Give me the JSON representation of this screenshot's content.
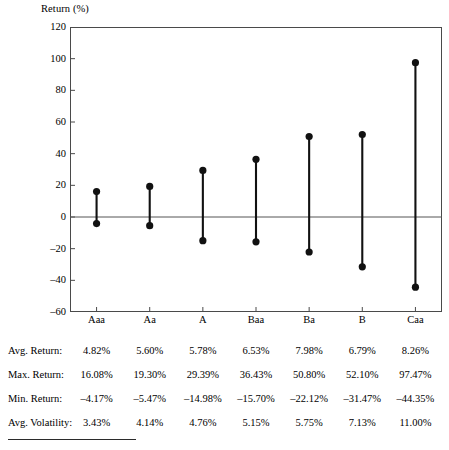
{
  "chart_data": {
    "type": "scatter",
    "title": "",
    "subtitle": "",
    "ylabel": "Return (%)",
    "xlabel": "",
    "ylim": [
      -60,
      120
    ],
    "yticks": [
      120,
      100,
      80,
      60,
      40,
      20,
      0,
      -20,
      -40,
      -60
    ],
    "ytick_labels": [
      "120",
      "100",
      "80",
      "60",
      "40",
      "20",
      "0",
      "–20",
      "–40",
      "–60"
    ],
    "grid": false,
    "legend": "none",
    "zero_line": 0,
    "categories": [
      "Aaa",
      "Aa",
      "A",
      "Baa",
      "Ba",
      "B",
      "Caa"
    ],
    "series": [
      {
        "name": "Max. Return",
        "values": [
          16.08,
          19.3,
          29.39,
          36.43,
          50.8,
          52.1,
          97.47
        ]
      },
      {
        "name": "Min. Return",
        "values": [
          -4.17,
          -5.47,
          -14.98,
          -15.7,
          -22.12,
          -31.47,
          -44.35
        ]
      }
    ],
    "marker": "filled-circle",
    "marker_color": "#111111",
    "stem_color": "#111111",
    "frame_color": "#4a4a4a"
  },
  "table": {
    "columns": [
      "Aaa",
      "Aa",
      "A",
      "Baa",
      "Ba",
      "B",
      "Caa"
    ],
    "rows": [
      {
        "label": "Avg. Return:",
        "values": [
          "4.82%",
          "5.60%",
          "5.78%",
          "6.53%",
          "7.98%",
          "6.79%",
          "8.26%"
        ]
      },
      {
        "label": "Max. Return:",
        "values": [
          "16.08%",
          "19.30%",
          "29.39%",
          "36.43%",
          "50.80%",
          "52.10%",
          "97.47%"
        ]
      },
      {
        "label": "Min. Return:",
        "values": [
          "–4.17%",
          "–5.47%",
          "–14.98%",
          "–15.70%",
          "–22.12%",
          "–31.47%",
          "–44.35%"
        ]
      },
      {
        "label": "Avg. Volatility:",
        "values": [
          "3.43%",
          "4.14%",
          "4.76%",
          "5.15%",
          "5.75%",
          "7.13%",
          "11.00%"
        ]
      }
    ]
  }
}
